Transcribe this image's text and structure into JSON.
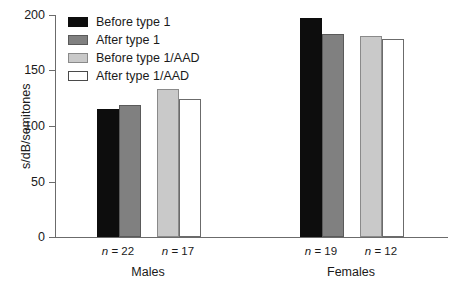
{
  "chart_data": {
    "type": "bar",
    "title": "",
    "subtitle": "",
    "xlabel": "",
    "ylabel": "s/dB/semitones",
    "ylim": [
      0,
      200
    ],
    "yticks": [
      0,
      50,
      100,
      150,
      200
    ],
    "ytick_labels": [
      "0",
      "50",
      "100",
      "150",
      "200"
    ],
    "grid": false,
    "legend_position": "top-left",
    "categories": [
      "Males",
      "Females"
    ],
    "series": [
      {
        "name": "Before type 1",
        "color": "#0d0d0d",
        "values": [
          115,
          197
        ]
      },
      {
        "name": "After type 1",
        "color": "#808080",
        "values": [
          119,
          183
        ]
      },
      {
        "name": "Before type 1/AAD",
        "color": "#c9c9c9",
        "values": [
          133,
          181
        ]
      },
      {
        "name": "After type 1/AAD",
        "color": "#ffffff",
        "values": [
          124,
          178
        ]
      }
    ],
    "annotations": [
      {
        "text": "n = 22",
        "group": "Males",
        "pair": "type 1"
      },
      {
        "text": "n = 17",
        "group": "Males",
        "pair": "type 1/AAD"
      },
      {
        "text": "n = 19",
        "group": "Females",
        "pair": "type 1"
      },
      {
        "text": "n = 12",
        "group": "Females",
        "pair": "type 1/AAD"
      }
    ]
  },
  "axis": {
    "y_title": "s/dB/semitones",
    "ticks": [
      {
        "label": "200",
        "value": 200
      },
      {
        "label": "150",
        "value": 150
      },
      {
        "label": "100",
        "value": 100
      },
      {
        "label": "50",
        "value": 50
      },
      {
        "label": "0",
        "value": 0
      }
    ]
  },
  "legend": {
    "items": [
      {
        "label": "Before type 1",
        "swatch": "swatch-dark"
      },
      {
        "label": "After type 1",
        "swatch": "swatch-mid"
      },
      {
        "label": "Before type 1/AAD",
        "swatch": "swatch-light"
      },
      {
        "label": "After type 1/AAD",
        "swatch": "swatch-white"
      }
    ]
  },
  "groups": [
    {
      "label": "Males",
      "n_labels": [
        {
          "prefix": "n",
          "rest": " = 22"
        },
        {
          "prefix": "n",
          "rest": " = 17"
        }
      ]
    },
    {
      "label": "Females",
      "n_labels": [
        {
          "prefix": "n",
          "rest": " = 19"
        },
        {
          "prefix": "n",
          "rest": " = 12"
        }
      ]
    }
  ],
  "colors": {
    "before_type1": "#0d0d0d",
    "after_type1": "#808080",
    "before_type1_aad": "#c9c9c9",
    "after_type1_aad": "#ffffff",
    "axis": "#6b6b6b",
    "text": "#1a1a1a",
    "background": "#ffffff"
  }
}
